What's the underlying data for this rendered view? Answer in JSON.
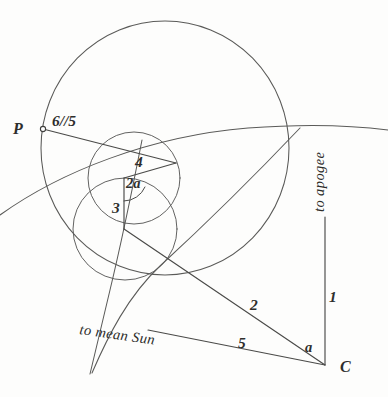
{
  "figure": {
    "background_color": "#fdfdfc",
    "ink_color": "#4a4a48",
    "labels": {
      "point_p": "P",
      "point_c": "C",
      "ratio_six_five": "6//5",
      "segment_four": "4",
      "segment_three": "3",
      "segment_two": "2",
      "segment_one": "1",
      "segment_five": "5",
      "angle_two_alpha": "2a",
      "angle_alpha": "a",
      "direction_apogee": "to apogee",
      "direction_mean_sun": "to mean Sun"
    },
    "geometry": {
      "deferent_circle": {
        "cx": 165,
        "cy": 148,
        "r": 125
      },
      "epicycle_upper": {
        "cx": 134,
        "cy": 178,
        "r": 46
      },
      "epicycle_lower": {
        "cx": 125,
        "cy": 228,
        "r": 52
      },
      "point_p": {
        "x": 43,
        "y": 129
      },
      "point_c": {
        "x": 325,
        "y": 365
      },
      "point_apex_4": {
        "x": 176,
        "y": 163
      },
      "point_center_2a": {
        "x": 124,
        "y": 178
      },
      "point_node_3": {
        "x": 124,
        "y": 229
      },
      "apogee_line": {
        "x1": 325,
        "y1": 365,
        "x2": 325,
        "y2": 218
      },
      "mean_sun_line": {
        "x1": 325,
        "y1": 365,
        "x2": 148,
        "y2": 330
      }
    }
  }
}
